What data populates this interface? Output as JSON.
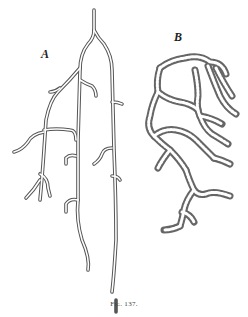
{
  "figure": {
    "label_a": "A",
    "label_b": "B",
    "caption": "Fig. 137."
  }
}
